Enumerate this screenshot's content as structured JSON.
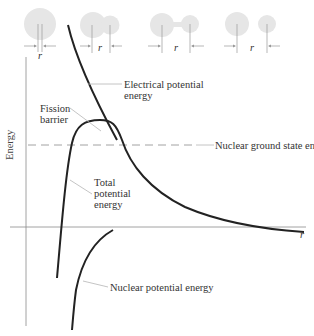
{
  "diagram": {
    "axis": {
      "y_label": "Energy",
      "x_label": "r"
    },
    "labels": {
      "electrical": [
        "Electrical potential",
        "energy"
      ],
      "fission_barrier": [
        "Fission",
        "barrier"
      ],
      "ground_state": "Nuclear ground state energy",
      "total": [
        "Total",
        "potential",
        "energy"
      ],
      "nuclear": "Nuclear potential energy"
    },
    "separation_stages": [
      {
        "id": "merged",
        "r_label": "r"
      },
      {
        "id": "touching",
        "r_label": "r"
      },
      {
        "id": "necked",
        "r_label": "r"
      },
      {
        "id": "separated",
        "r_label": "r"
      }
    ],
    "colors": {
      "curve": "#222222",
      "axis": "#8a8a8a",
      "leader": "#b5b5b5",
      "nucleus": "#e6e6e6",
      "dashed": "#8a8a8a"
    }
  }
}
